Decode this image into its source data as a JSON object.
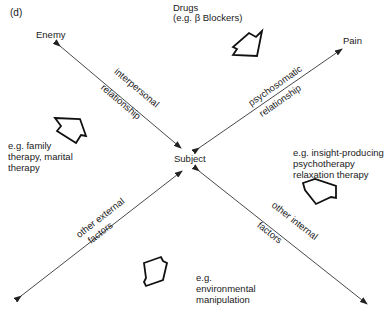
{
  "figure": {
    "panel_label": "(d)",
    "center_node": "Subject",
    "nodes": {
      "top_left": "Enemy",
      "top_right": "Pain"
    },
    "relationships": {
      "top_left": {
        "line1": "interpersonal",
        "line2": "relationship"
      },
      "top_right": {
        "line1": "psychosomatic",
        "line2": "relationship"
      },
      "bottom_left": {
        "line1": "other external",
        "line2": "factors"
      },
      "bottom_right": {
        "line1": "other internal",
        "line2": "factors"
      }
    },
    "interventions": {
      "top": {
        "line1": "Drugs",
        "line2": "(e.g. β  Blockers)"
      },
      "left": {
        "line1": "e.g. family",
        "line2": "therapy, marital",
        "line3": "therapy"
      },
      "right": {
        "line1": "e.g. insight-producing",
        "line2": "psychotherapy",
        "line3": "relaxation therapy"
      },
      "bottom": {
        "line1": "e.g.",
        "line2": "environmental",
        "line3": "manipulation"
      }
    },
    "colors": {
      "line": "#333333",
      "text": "#1a1a1a",
      "background": "#ffffff"
    }
  }
}
